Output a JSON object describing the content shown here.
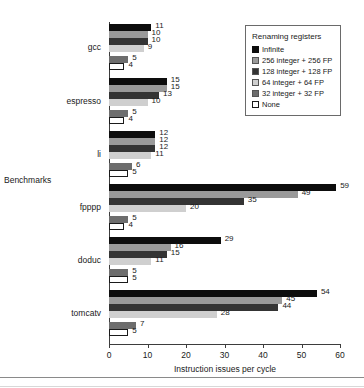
{
  "chart_data": {
    "type": "bar",
    "orientation": "horizontal",
    "title": "",
    "xlabel": "Instruction issues per cycle",
    "ylabel": "Benchmarks",
    "xlim": [
      0,
      60
    ],
    "xticks": [
      0,
      10,
      20,
      30,
      40,
      50,
      60
    ],
    "grid": false,
    "legend_title": "Renaming registers",
    "legend_position": "top-right",
    "categories": [
      "gcc",
      "espresso",
      "li",
      "fpppp",
      "doduc",
      "tomcatv"
    ],
    "series": [
      {
        "name": "Infinite",
        "color": "#0d0d0d",
        "values": [
          11,
          15,
          12,
          59,
          29,
          54
        ]
      },
      {
        "name": "256 integer + 256 FP",
        "color": "#9a9a9a",
        "values": [
          10,
          15,
          12,
          49,
          16,
          45
        ]
      },
      {
        "name": "128 integer + 128 FP",
        "color": "#343434",
        "values": [
          10,
          13,
          12,
          35,
          15,
          44
        ]
      },
      {
        "name": "64 integer + 64 FP",
        "color": "#cfcfcf",
        "values": [
          9,
          10,
          11,
          20,
          11,
          28
        ]
      },
      {
        "name": "32 integer + 32 FP",
        "color": "#6d6d6d",
        "values": [
          5,
          5,
          6,
          5,
          5,
          7
        ]
      },
      {
        "name": "None",
        "color": "#ffffff",
        "values": [
          4,
          4,
          5,
          4,
          5,
          5
        ]
      }
    ]
  },
  "axis": {
    "x_title": "Instruction issues per cycle",
    "y_title": "Benchmarks",
    "x_tick_labels": [
      "0",
      "10",
      "20",
      "30",
      "40",
      "50",
      "60"
    ],
    "y_tick_labels": [
      "gcc",
      "espresso",
      "li",
      "fpppp",
      "doduc",
      "tomcatv"
    ]
  },
  "legend": {
    "title": "Renaming registers",
    "items": [
      {
        "label": "Infinite",
        "color": "#0d0d0d",
        "outlined": false
      },
      {
        "label": "256 integer + 256 FP",
        "color": "#9a9a9a",
        "outlined": false
      },
      {
        "label": "128 integer + 128 FP",
        "color": "#343434",
        "outlined": false
      },
      {
        "label": "64 integer + 64 FP",
        "color": "#cfcfcf",
        "outlined": false
      },
      {
        "label": "32 integer + 32 FP",
        "color": "#6d6d6d",
        "outlined": false
      },
      {
        "label": "None",
        "color": "#ffffff",
        "outlined": true
      }
    ]
  }
}
